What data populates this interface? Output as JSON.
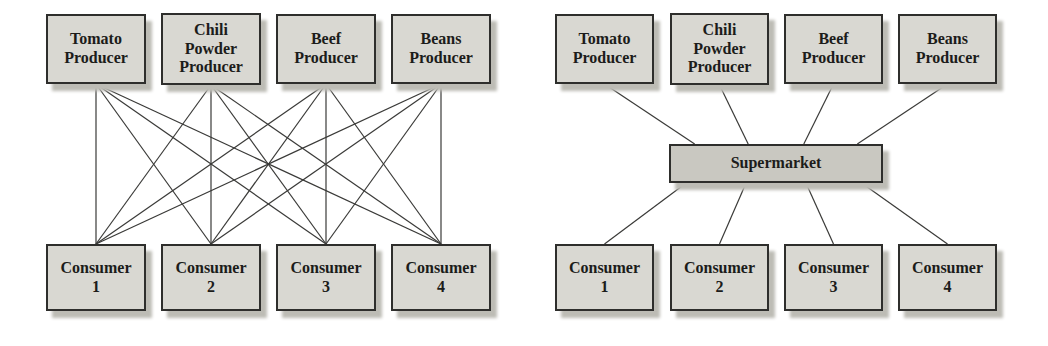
{
  "figure": {
    "background_color": "#ffffff",
    "box_fill_color": "#d9d8d2",
    "intermediary_fill_color": "#c9c8c1",
    "box_border_color": "#2e2e2c",
    "shadow_color": "#bdbcb5",
    "connector_color": "#3a3a38",
    "panels": [
      {
        "name": "direct-exchange",
        "nodes": [
          {
            "id": "p1",
            "label": "Tomato\nProducer"
          },
          {
            "id": "p2",
            "label": "Chili\nPowder\nProducer"
          },
          {
            "id": "p3",
            "label": "Beef\nProducer"
          },
          {
            "id": "p4",
            "label": "Beans\nProducer"
          },
          {
            "id": "c1",
            "label": "Consumer\n1"
          },
          {
            "id": "c2",
            "label": "Consumer\n2"
          },
          {
            "id": "c3",
            "label": "Consumer\n3"
          },
          {
            "id": "c4",
            "label": "Consumer\n4"
          }
        ],
        "edges": [
          {
            "f": "p1",
            "t": "c1"
          },
          {
            "f": "p1",
            "t": "c2"
          },
          {
            "f": "p1",
            "t": "c3"
          },
          {
            "f": "p1",
            "t": "c4"
          },
          {
            "f": "p2",
            "t": "c1"
          },
          {
            "f": "p2",
            "t": "c2"
          },
          {
            "f": "p2",
            "t": "c3"
          },
          {
            "f": "p2",
            "t": "c4"
          },
          {
            "f": "p3",
            "t": "c1"
          },
          {
            "f": "p3",
            "t": "c2"
          },
          {
            "f": "p3",
            "t": "c3"
          },
          {
            "f": "p3",
            "t": "c4"
          },
          {
            "f": "p4",
            "t": "c1"
          },
          {
            "f": "p4",
            "t": "c2"
          },
          {
            "f": "p4",
            "t": "c3"
          },
          {
            "f": "p4",
            "t": "c4"
          }
        ]
      },
      {
        "name": "intermediated-exchange",
        "nodes": [
          {
            "id": "p1",
            "label": "Tomato\nProducer"
          },
          {
            "id": "p2",
            "label": "Chili\nPowder\nProducer"
          },
          {
            "id": "p3",
            "label": "Beef\nProducer"
          },
          {
            "id": "p4",
            "label": "Beans\nProducer"
          },
          {
            "id": "m",
            "label": "Supermarket"
          },
          {
            "id": "c1",
            "label": "Consumer\n1"
          },
          {
            "id": "c2",
            "label": "Consumer\n2"
          },
          {
            "id": "c3",
            "label": "Consumer\n3"
          },
          {
            "id": "c4",
            "label": "Consumer\n4"
          }
        ],
        "edges": [
          {
            "f": "p1",
            "t": "m",
            "tx": 0.12
          },
          {
            "f": "p2",
            "t": "m",
            "tx": 0.37
          },
          {
            "f": "p3",
            "t": "m",
            "tx": 0.63
          },
          {
            "f": "p4",
            "t": "m",
            "tx": 0.88
          },
          {
            "f": "m",
            "t": "c1",
            "fx": 0.08
          },
          {
            "f": "m",
            "t": "c2",
            "fx": 0.36
          },
          {
            "f": "m",
            "t": "c3",
            "fx": 0.64
          },
          {
            "f": "m",
            "t": "c4",
            "fx": 0.9
          }
        ]
      }
    ]
  }
}
